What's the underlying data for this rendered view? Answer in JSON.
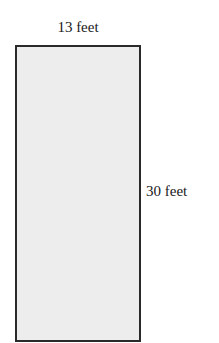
{
  "diagram": {
    "shape": "rectangle",
    "fill_color": "#ededed",
    "stroke_color": "#2a2a2a",
    "width_label": "13 feet",
    "height_label": "30 feet"
  }
}
